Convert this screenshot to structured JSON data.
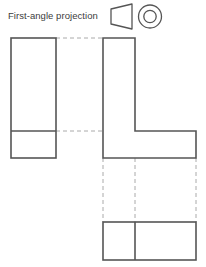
{
  "figure": {
    "caption": "First-angle projection",
    "symbol": {
      "name": "first-angle-projection-symbol",
      "cone_side_view": "trapezoid",
      "cone_end_view": "concentric-circles",
      "circle_count": 2
    },
    "colors": {
      "background": "#ffffff",
      "solid_line": "#555555",
      "dashed_line": "#aaaaaa",
      "text": "#3c3c3c"
    },
    "line_widths": {
      "solid": 1.6,
      "dashed": 1.0,
      "symbol": 1.3
    },
    "dash_pattern": "4 3"
  },
  "views": [
    {
      "name": "left-side-view",
      "shape": "rectangle-with-horizontal-divider",
      "x": 11,
      "y": 38,
      "width": 45,
      "height": 120,
      "divider_y": 131
    },
    {
      "name": "front-view",
      "shape": "L-shape",
      "x": 103,
      "y": 38,
      "width": 93,
      "height": 120,
      "leg_width": 32,
      "foot_top_y": 131,
      "points": "103,38 135,38 135,131 196,131 196,158 103,158"
    },
    {
      "name": "bottom-view",
      "shape": "rectangle-with-vertical-divider",
      "x": 103,
      "y": 222,
      "width": 93,
      "height": 38,
      "divider_x": 135
    }
  ],
  "projection_lines": [
    {
      "name": "projector-top-horizontal",
      "orientation": "horizontal",
      "x1": 56,
      "y1": 38,
      "x2": 103,
      "y2": 38
    },
    {
      "name": "projector-mid-horizontal",
      "orientation": "horizontal",
      "x1": 56,
      "y1": 131,
      "x2": 103,
      "y2": 131
    },
    {
      "name": "projector-left-vertical",
      "orientation": "vertical",
      "x1": 103,
      "y1": 158,
      "x2": 103,
      "y2": 222
    },
    {
      "name": "projector-center-vertical",
      "orientation": "vertical",
      "x1": 135,
      "y1": 158,
      "x2": 135,
      "y2": 222
    },
    {
      "name": "projector-right-vertical",
      "orientation": "vertical",
      "x1": 196,
      "y1": 158,
      "x2": 196,
      "y2": 222
    }
  ]
}
